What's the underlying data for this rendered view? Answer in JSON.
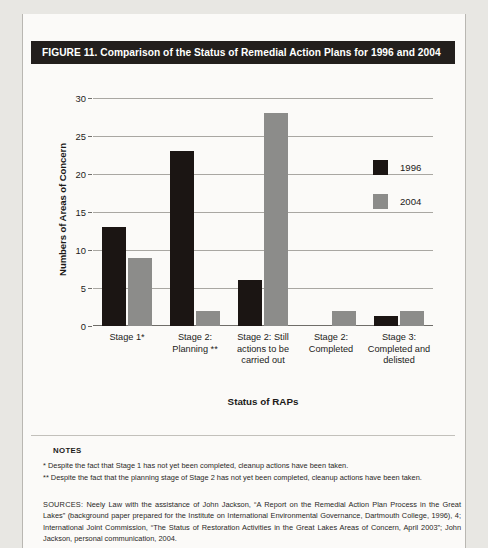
{
  "figure": {
    "title": "FIGURE 11. Comparison of the Status of Remedial Action Plans for 1996 and 2004"
  },
  "notes": {
    "heading": "NOTES",
    "items": [
      "* Despite the fact that Stage 1 has not yet been completed, cleanup actions have been taken.",
      "** Despite the fact that the planning stage of Stage 2 has not yet been completed, cleanup actions have been taken."
    ]
  },
  "sources": {
    "kicker": "SOURCES:",
    "text": " Neely Law with the assistance of John Jackson, “A Report on the Remedial Action Plan Process in the Great Lakes” (background paper prepared for the Institute on International Environmental Governance, Dartmouth College, 1996), 4; International Joint Commission, “The Status of Restoration Activities in the Great Lakes Areas of Concern, April 2003”; John Jackson, personal communication, 2004."
  },
  "colors": {
    "series_1996": "#1b1513",
    "series_2004": "#8c8c8a",
    "title_bar": "#231f1d",
    "panel": "#fbfaf8",
    "page": "#e8e7e3",
    "gridline": "#a9a7a2"
  },
  "chart_data": {
    "type": "bar",
    "title": "Comparison of the Status of Remedial Action Plans for 1996 and 2004",
    "xlabel": "Status of RAPs",
    "ylabel": "Numbers of Areas of Concern",
    "categories": [
      "Stage 1*",
      "Stage 2: Planning **",
      "Stage 2: Still actions to be carried out",
      "Stage 2: Completed",
      "Stage 3: Completed and delisted"
    ],
    "series": [
      {
        "name": "1996",
        "color": "#1b1513",
        "values": [
          13,
          23,
          6,
          0,
          1.3
        ]
      },
      {
        "name": "2004",
        "color": "#8c8c8a",
        "values": [
          9,
          2,
          28,
          2,
          2
        ]
      }
    ],
    "ylim": [
      0,
      30
    ],
    "yticks": [
      0,
      5,
      10,
      15,
      20,
      25,
      30
    ],
    "grid": true,
    "legend_position": "right"
  }
}
